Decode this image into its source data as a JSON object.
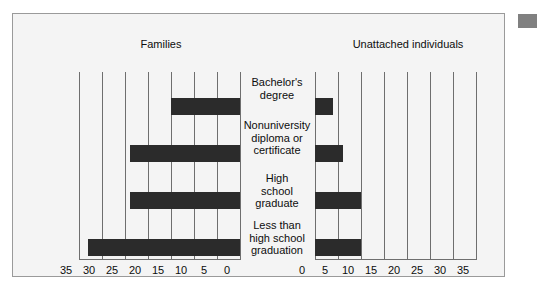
{
  "chart_data": {
    "type": "bar",
    "orientation": "horizontal-diverging",
    "title": "",
    "categories": [
      "Bachelor's degree",
      "Nonuniversity diploma or certificate",
      "High school graduate",
      "Less than high school graduation"
    ],
    "category_label_lines": [
      [
        "Bachelor's",
        "degree"
      ],
      [
        "Nonuniversity",
        "diploma or",
        "certificate"
      ],
      [
        "High",
        "school",
        "graduate"
      ],
      [
        "Less than",
        "high school",
        "graduation"
      ]
    ],
    "series": [
      {
        "name": "Families",
        "side": "left",
        "values": [
          15,
          24,
          24,
          33
        ],
        "axis_ticks": [
          35,
          30,
          25,
          20,
          15,
          10,
          5,
          0
        ],
        "axis_range": [
          0,
          35
        ],
        "axis_direction": "right-to-left"
      },
      {
        "name": "Unattached individuals",
        "side": "right",
        "values": [
          4,
          6,
          10,
          10
        ],
        "axis_ticks": [
          0,
          5,
          10,
          15,
          20,
          25,
          30,
          35
        ],
        "axis_range": [
          0,
          35
        ],
        "axis_direction": "left-to-right"
      }
    ],
    "xlabel": "",
    "ylabel": "",
    "grid": true,
    "legend": "panel-headers",
    "bar_color": "#2b2b2b",
    "gridline_color": "#6e6e6e",
    "panel_background": "#f4f4f4"
  },
  "panel": {
    "headers": {
      "left": "Families",
      "right": "Unattached individuals"
    }
  }
}
